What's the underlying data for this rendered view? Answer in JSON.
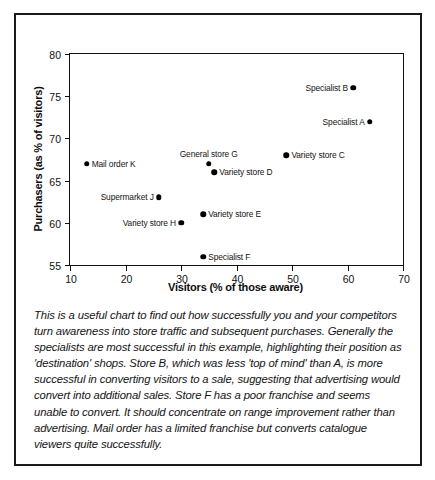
{
  "figure": {
    "caption": "This is a useful chart to find out how successfully you and your competitors turn awareness into store traffic and subsequent purchases. Generally the specialists are most successful in this example, highlighting their position as 'destination' shops. Store B, which was less 'top of mind' than A, is more successful in converting visitors to a sale, suggesting that advertising would convert into additional sales. Store F has a poor franchise and seems unable to convert. It should concentrate on range improvement rather than advertising. Mail order has a limited franchise but converts catalogue viewers quite successfully."
  },
  "chart_data": {
    "type": "scatter",
    "title": "",
    "xlabel": "Visitors (% of those aware)",
    "ylabel": "Purchasers (as % of visitors)",
    "xlim": [
      10,
      70
    ],
    "ylim": [
      55,
      80
    ],
    "xticks": [
      10,
      20,
      30,
      40,
      50,
      60,
      70
    ],
    "yticks": [
      55,
      60,
      65,
      70,
      75,
      80
    ],
    "grid": false,
    "legend": "none",
    "marker_color": "#000000",
    "axis_color": "#111111",
    "points": [
      {
        "label": "Specialist B",
        "x": 61,
        "y": 76,
        "label_side": "left"
      },
      {
        "label": "Specialist A",
        "x": 64,
        "y": 72,
        "label_side": "left"
      },
      {
        "label": "Variety store C",
        "x": 49,
        "y": 68,
        "label_side": "right"
      },
      {
        "label": "General store G",
        "x": 35,
        "y": 67,
        "label_side": "above"
      },
      {
        "label": "Mail order K",
        "x": 13,
        "y": 67,
        "label_side": "right"
      },
      {
        "label": "Variety store D",
        "x": 36,
        "y": 66,
        "label_side": "right"
      },
      {
        "label": "Supermarket J",
        "x": 26,
        "y": 63,
        "label_side": "left"
      },
      {
        "label": "Variety store E",
        "x": 34,
        "y": 61,
        "label_side": "right"
      },
      {
        "label": "Variety store H",
        "x": 30,
        "y": 60,
        "label_side": "left"
      },
      {
        "label": "Specialist F",
        "x": 34,
        "y": 56,
        "label_side": "right"
      }
    ]
  }
}
